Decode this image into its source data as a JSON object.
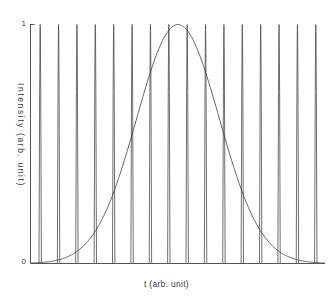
{
  "figure": {
    "title": "",
    "background_color": "#ffffff",
    "axis_color": "#555555",
    "pulse_color": "#4a4a4a",
    "envelope_color": "#3c3c3c",
    "width": 333,
    "height": 298
  },
  "axes": {
    "x_label": "t (arb. unit)",
    "y_label": "Intensity (arb. unit)",
    "y_ticks": [
      "0",
      "1"
    ],
    "y_tick_top": "1",
    "y_tick_bottom": "0",
    "x_ticks": [],
    "grid": "off",
    "frame": "left-bottom"
  },
  "chart_data": {
    "type": "line",
    "title": "",
    "xlabel": "t (arb. unit)",
    "ylabel": "Intensity (arb. unit)",
    "xlim": [
      0,
      16
    ],
    "ylim": [
      0,
      1
    ],
    "grid": false,
    "legend": "none",
    "x_tick_labels": [],
    "y_tick_labels": [
      "0",
      "1"
    ],
    "series": [
      {
        "name": "pulse-train",
        "description": "Periodic train of sharp intensity pulses of equal unit amplitude",
        "type": "line",
        "period": 1.0,
        "pulse_count": 16,
        "pulse_width_fraction": 0.13,
        "peak_value": 1.0,
        "baseline_value": 0.0,
        "peak_positions": [
          0.5,
          1.5,
          2.5,
          3.5,
          4.5,
          5.5,
          6.5,
          7.5,
          8.5,
          9.5,
          10.5,
          11.5,
          12.5,
          13.5,
          14.5,
          15.5
        ],
        "peak_values": [
          1,
          1,
          1,
          1,
          1,
          1,
          1,
          1,
          1,
          1,
          1,
          1,
          1,
          1,
          1,
          1
        ]
      },
      {
        "name": "gaussian-envelope",
        "description": "Gaussian envelope curve peaking at the centre of the record",
        "type": "line",
        "center": 8.0,
        "fwhm": 5.3,
        "peak_value": 1.0,
        "x": [
          0.0,
          1.0,
          2.0,
          3.0,
          4.0,
          4.5,
          5.0,
          5.5,
          6.0,
          6.5,
          7.0,
          7.5,
          8.0,
          8.5,
          9.0,
          9.5,
          10.0,
          10.5,
          11.0,
          11.5,
          12.0,
          13.0,
          14.0,
          15.0,
          16.0
        ],
        "y": [
          0.0,
          0.001,
          0.008,
          0.043,
          0.16,
          0.26,
          0.39,
          0.54,
          0.69,
          0.83,
          0.93,
          0.99,
          1.0,
          0.99,
          0.93,
          0.83,
          0.69,
          0.54,
          0.39,
          0.26,
          0.16,
          0.043,
          0.008,
          0.001,
          0.0
        ]
      }
    ]
  }
}
